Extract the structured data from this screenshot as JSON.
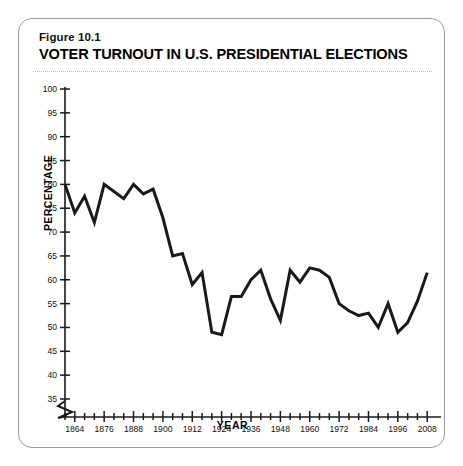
{
  "figure": {
    "number": "Figure 10.1",
    "title": "VOTER TURNOUT IN U.S. PRESIDENTIAL ELECTIONS"
  },
  "chart_data": {
    "type": "line",
    "title": "VOTER TURNOUT IN U.S. PRESIDENTIAL ELECTIONS",
    "subtitle": "Figure 10.1",
    "xlabel": "YEAR",
    "ylabel": "PERCENTAGE",
    "xlim": [
      1860,
      2012
    ],
    "ylim": [
      35,
      100
    ],
    "y_axis_break": true,
    "y_tick_step": 5,
    "x_tick_step": 4,
    "x_label_step": 12,
    "grid": false,
    "legend": null,
    "line_color": "#1a1a1a",
    "line_width": 3,
    "y_ticks": [
      35,
      40,
      45,
      50,
      55,
      60,
      65,
      70,
      75,
      80,
      85,
      90,
      95,
      100
    ],
    "x_tick_labels": [
      1864,
      1876,
      1888,
      1900,
      1912,
      1924,
      1936,
      1948,
      1960,
      1972,
      1984,
      1996,
      2008
    ],
    "x": [
      1860,
      1864,
      1868,
      1872,
      1876,
      1880,
      1884,
      1888,
      1892,
      1896,
      1900,
      1904,
      1908,
      1912,
      1916,
      1920,
      1924,
      1928,
      1932,
      1936,
      1940,
      1944,
      1948,
      1952,
      1956,
      1960,
      1964,
      1968,
      1972,
      1976,
      1980,
      1984,
      1988,
      1992,
      1996,
      2000,
      2004,
      2008
    ],
    "values": [
      80.0,
      74.0,
      77.5,
      72.0,
      80.0,
      78.5,
      77.0,
      80.0,
      78.0,
      79.0,
      73.0,
      65.0,
      65.5,
      59.0,
      61.5,
      49.0,
      48.5,
      56.5,
      56.5,
      60.0,
      62.0,
      56.0,
      51.5,
      62.0,
      59.5,
      62.5,
      62.0,
      60.5,
      55.0,
      53.5,
      52.5,
      53.0,
      50.0,
      55.0,
      49.0,
      51.0,
      55.5,
      61.5
    ]
  }
}
